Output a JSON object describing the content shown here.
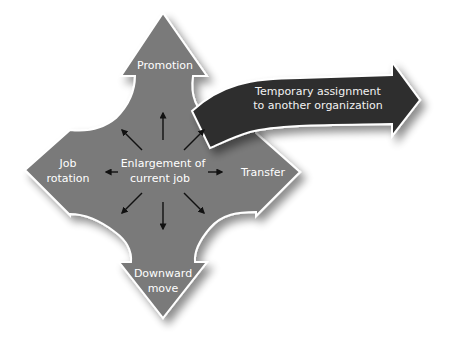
{
  "diagram": {
    "type": "career-movement-options",
    "center": {
      "label_line1": "Enlargement of",
      "label_line2": "current job"
    },
    "arrows": {
      "up": {
        "label_line1": "Promotion"
      },
      "left": {
        "label_line1": "Job",
        "label_line2": "rotation"
      },
      "right": {
        "label_line1": "Transfer"
      },
      "down": {
        "label_line1": "Downward",
        "label_line2": "move"
      },
      "external": {
        "label_line1": "Temporary assignment",
        "label_line2": "to another organization"
      }
    },
    "colors": {
      "cross_fill": "#7a7a7a",
      "external_fill": "#2e2e2e",
      "outline": "#ffffff",
      "text": "#ffffff",
      "inner_arrows": "#111111"
    }
  }
}
